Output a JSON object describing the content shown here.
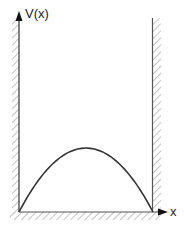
{
  "diagram": {
    "type": "potential-well",
    "y_axis_label": "V(x)",
    "x_axis_label": "x",
    "curve": "parabolic barrier inside infinite walls",
    "colors": {
      "line": "#333333",
      "axis": "#444444",
      "hatch": "#b0b0b0"
    }
  }
}
